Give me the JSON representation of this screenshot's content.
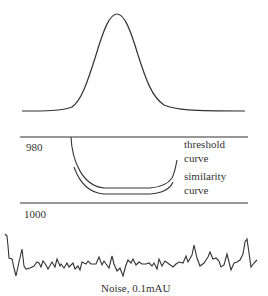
{
  "diagram": {
    "panels": {
      "peak": {
        "description": "Gaussian chromatographic peak"
      },
      "similarity": {
        "top_axis_label": "980",
        "bottom_axis_label": "1000",
        "threshold_label_line1": "threshold",
        "threshold_label_line2": "curve",
        "similarity_label_line1": "similarity",
        "similarity_label_line2": "curve"
      },
      "noise": {
        "caption": "Noise, 0.1mAU"
      }
    },
    "colors": {
      "line": "#333333",
      "background": "#ffffff"
    }
  }
}
